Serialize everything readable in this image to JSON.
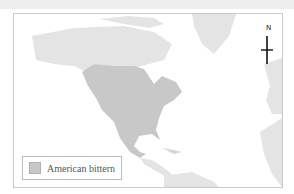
{
  "map": {
    "title": "",
    "legend": {
      "items": [
        {
          "label": "American bittern",
          "color": "#c8c8c8"
        }
      ]
    },
    "compass": {
      "label": "N"
    },
    "colors": {
      "land": "#e4e4e4",
      "range": "#c8c8c8",
      "water": "#ffffff"
    }
  }
}
